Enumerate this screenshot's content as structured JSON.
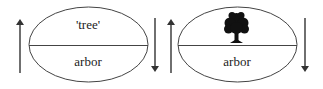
{
  "diagram": {
    "colors": {
      "stroke": "#333333",
      "text": "#222222",
      "background": "#ffffff"
    },
    "signs": [
      {
        "id": "sign-left",
        "signified": {
          "type": "text",
          "label": "'tree'"
        },
        "signifier": {
          "type": "text",
          "label": "arbor"
        },
        "arrows": {
          "left": "up",
          "right": "down"
        }
      },
      {
        "id": "sign-right",
        "signified": {
          "type": "icon",
          "icon": "tree-icon"
        },
        "signifier": {
          "type": "text",
          "label": "arbor"
        },
        "arrows": {
          "left": "up",
          "right": "down"
        }
      }
    ]
  }
}
